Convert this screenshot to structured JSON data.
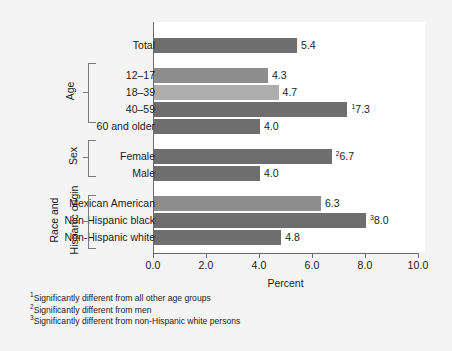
{
  "chart_data": {
    "type": "bar",
    "orientation": "horizontal",
    "title": "",
    "xlabel": "Percent",
    "ylabel": "",
    "xlim": [
      0,
      10
    ],
    "xticks": [
      "0.0",
      "2.0",
      "4.0",
      "6.0",
      "8.0",
      "10.0"
    ],
    "xtick_values": [
      0,
      2,
      4,
      6,
      8,
      10
    ],
    "grid": false,
    "legend": "none",
    "categories": [
      "Total",
      "12–17",
      "18–39",
      "40–59",
      "60 and older",
      "Female",
      "Male",
      "Mexican American",
      "Non-Hispanic black",
      "Non-Hispanic white"
    ],
    "values": [
      5.4,
      4.3,
      4.7,
      7.3,
      4.0,
      6.7,
      4.0,
      6.3,
      8.0,
      4.8
    ],
    "value_labels": [
      "5.4",
      "4.3",
      "4.7",
      "7.3",
      "4.0",
      "6.7",
      "4.0",
      "6.3",
      "8.0",
      "4.8"
    ],
    "footnote_markers": [
      "",
      "",
      "",
      "1",
      "",
      "2",
      "",
      "",
      "3",
      ""
    ],
    "bar_colors": [
      "#6e6e6e",
      "#8d8d8d",
      "#adadad",
      "#6e6e6e",
      "#6e6e6e",
      "#6e6e6e",
      "#6e6e6e",
      "#8d8d8d",
      "#6e6e6e",
      "#6e6e6e"
    ],
    "groups": [
      {
        "title": "Age",
        "categories": [
          "12–17",
          "18–39",
          "40–59",
          "60 and older"
        ]
      },
      {
        "title": "Sex",
        "categories": [
          "Female",
          "Male"
        ]
      },
      {
        "title": "Race and Hispanic origin",
        "categories": [
          "Mexican American",
          "Non-Hispanic black",
          "Non-Hispanic white"
        ]
      }
    ]
  },
  "axis": {
    "x_title": "Percent",
    "ticks": [
      {
        "label": "0.0",
        "value": 0
      },
      {
        "label": "2.0",
        "value": 2
      },
      {
        "label": "4.0",
        "value": 4
      },
      {
        "label": "6.0",
        "value": 6
      },
      {
        "label": "8.0",
        "value": 8
      },
      {
        "label": "10.0",
        "value": 10
      }
    ]
  },
  "rows": [
    {
      "label": "Total",
      "value": 5.4,
      "value_label": "5.4",
      "marker": "",
      "color": "#6e6e6e"
    },
    {
      "label": "12–17",
      "value": 4.3,
      "value_label": "4.3",
      "marker": "",
      "color": "#8d8d8d"
    },
    {
      "label": "18–39",
      "value": 4.7,
      "value_label": "4.7",
      "marker": "",
      "color": "#adadad"
    },
    {
      "label": "40–59",
      "value": 7.3,
      "value_label": "7.3",
      "marker": "1",
      "color": "#6e6e6e"
    },
    {
      "label": "60 and older",
      "value": 4.0,
      "value_label": "4.0",
      "marker": "",
      "color": "#6e6e6e"
    },
    {
      "label": "Female",
      "value": 6.7,
      "value_label": "6.7",
      "marker": "2",
      "color": "#6e6e6e"
    },
    {
      "label": "Male",
      "value": 4.0,
      "value_label": "4.0",
      "marker": "",
      "color": "#6e6e6e"
    },
    {
      "label": "Mexican American",
      "value": 6.3,
      "value_label": "6.3",
      "marker": "",
      "color": "#8d8d8d"
    },
    {
      "label": "Non-Hispanic black",
      "value": 8.0,
      "value_label": "8.0",
      "marker": "3",
      "color": "#6e6e6e"
    },
    {
      "label": "Non-Hispanic white",
      "value": 4.8,
      "value_label": "4.8",
      "marker": "",
      "color": "#6e6e6e"
    }
  ],
  "groups": {
    "age": "Age",
    "sex": "Sex",
    "race_line1": "Race and",
    "race_line2": "Hispanic origin"
  },
  "footnotes": [
    {
      "marker": "1",
      "text": "Significantly different from all other age groups"
    },
    {
      "marker": "2",
      "text": "Significantly different from men"
    },
    {
      "marker": "3",
      "text": "Significantly different from non-Hispanic white persons"
    }
  ]
}
